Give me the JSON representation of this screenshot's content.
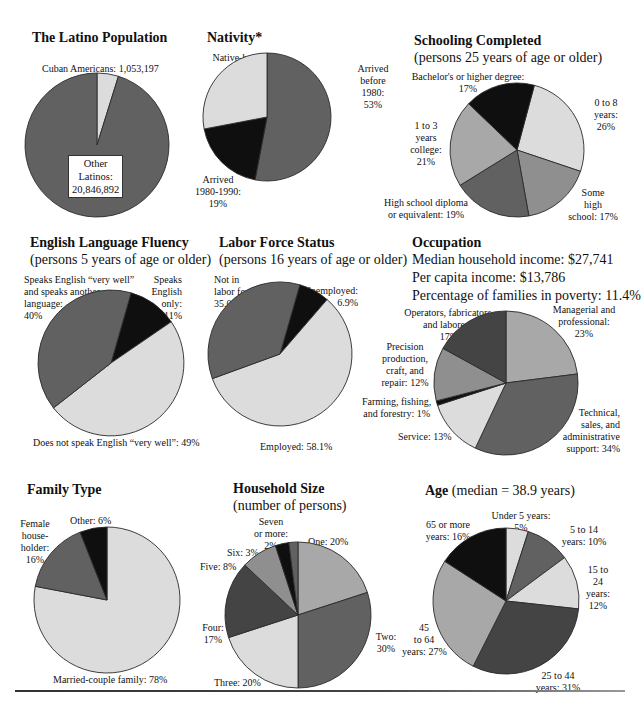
{
  "colors": {
    "light": "#dcdcdc",
    "mid": "#8f8f8f",
    "midlight": "#a8a8a8",
    "dark": "#616161",
    "darker": "#444444",
    "black": "#0f0f0f",
    "stroke": "#2a2a2a"
  },
  "chart_data": [
    {
      "id": "latino_population",
      "type": "pie",
      "title": "The Latino Population",
      "subtitle": "",
      "slices": [
        {
          "label": "Cuban Americans",
          "value": 1053197,
          "display": "Cuban Americans: 1,053,197",
          "color": "light"
        },
        {
          "label": "Other Latinos",
          "value": 20846892,
          "display": "Other Latinos: 20,846,892",
          "color": "dark"
        }
      ],
      "start_angle_deg": 0,
      "direction": "clockwise"
    },
    {
      "id": "nativity",
      "type": "pie",
      "title": "Nativity*",
      "subtitle": "",
      "slices": [
        {
          "label": "Arrived before 1980",
          "value": 53,
          "unit": "%",
          "color": "dark"
        },
        {
          "label": "Arrived 1980-1990",
          "value": 19,
          "unit": "%",
          "color": "black"
        },
        {
          "label": "Native-born",
          "value": 28,
          "unit": "%",
          "color": "light"
        }
      ],
      "start_angle_deg": 0,
      "direction": "clockwise"
    },
    {
      "id": "schooling_completed",
      "type": "pie",
      "title": "Schooling Completed",
      "subtitle": "(persons 25 years of age or older)",
      "slices": [
        {
          "label": "0 to 8 years",
          "value": 26,
          "unit": "%",
          "color": "light"
        },
        {
          "label": "Some high school",
          "value": 17,
          "unit": "%",
          "color": "mid"
        },
        {
          "label": "High school diploma or equivalent",
          "value": 19,
          "unit": "%",
          "color": "dark"
        },
        {
          "label": "1 to 3 years college",
          "value": 21,
          "unit": "%",
          "color": "midlight"
        },
        {
          "label": "Bachelor's or higher degree",
          "value": 17,
          "unit": "%",
          "color": "black"
        }
      ],
      "start_angle_deg": 15,
      "direction": "clockwise"
    },
    {
      "id": "english_language_fluency",
      "type": "pie",
      "title": "English Language Fluency",
      "subtitle": "(persons 5 years of age or older)",
      "slices": [
        {
          "label": "Speaks English only",
          "value": 11,
          "unit": "%",
          "color": "black"
        },
        {
          "label": "Does not speak English “very well”",
          "value": 49,
          "unit": "%",
          "color": "light"
        },
        {
          "label": "Speaks English “very well” and speaks another language",
          "value": 40,
          "unit": "%",
          "color": "dark"
        }
      ],
      "start_angle_deg": 16,
      "direction": "clockwise"
    },
    {
      "id": "labor_force_status",
      "type": "pie",
      "title": "Labor Force Status",
      "subtitle": "(persons 16 years of age or older)",
      "slices": [
        {
          "label": "Unemployed",
          "value": 6.9,
          "unit": "%",
          "color": "black"
        },
        {
          "label": "Employed",
          "value": 58.1,
          "unit": "%",
          "color": "light"
        },
        {
          "label": "Not in labor force",
          "value": 35.0,
          "unit": "%",
          "color": "dark"
        }
      ],
      "start_angle_deg": 16,
      "direction": "clockwise"
    },
    {
      "id": "occupation",
      "type": "pie",
      "title": "Occupation",
      "subtitle": "",
      "slices": [
        {
          "label": "Managerial and professional",
          "value": 23,
          "unit": "%",
          "color": "midlight"
        },
        {
          "label": "Technical, sales, and administrative support",
          "value": 34,
          "unit": "%",
          "color": "dark"
        },
        {
          "label": "Service",
          "value": 13,
          "unit": "%",
          "color": "light"
        },
        {
          "label": "Farming, fishing, and forestry",
          "value": 1,
          "unit": "%",
          "color": "black"
        },
        {
          "label": "Precision production, craft, and repair",
          "value": 12,
          "unit": "%",
          "color": "mid"
        },
        {
          "label": "Operators, fabricators, and laborers",
          "value": 17,
          "unit": "%",
          "color": "darker"
        }
      ],
      "start_angle_deg": 0,
      "direction": "clockwise"
    },
    {
      "id": "family_type",
      "type": "pie",
      "title": "Family Type",
      "subtitle": "",
      "slices": [
        {
          "label": "Married-couple family",
          "value": 78,
          "unit": "%",
          "color": "light"
        },
        {
          "label": "Female householder",
          "value": 16,
          "unit": "%",
          "color": "dark"
        },
        {
          "label": "Other",
          "value": 6,
          "unit": "%",
          "color": "black"
        }
      ],
      "start_angle_deg": 0,
      "direction": "clockwise"
    },
    {
      "id": "household_size",
      "type": "pie",
      "title": "Household Size",
      "subtitle": "(number of persons)",
      "slices": [
        {
          "label": "One",
          "value": 20,
          "unit": "%",
          "color": "midlight"
        },
        {
          "label": "Two",
          "value": 30,
          "unit": "%",
          "color": "dark"
        },
        {
          "label": "Three",
          "value": 20,
          "unit": "%",
          "color": "light"
        },
        {
          "label": "Four",
          "value": 17,
          "unit": "%",
          "color": "darker"
        },
        {
          "label": "Five",
          "value": 8,
          "unit": "%",
          "color": "mid"
        },
        {
          "label": "Six",
          "value": 3,
          "unit": "%",
          "color": "black"
        },
        {
          "label": "Seven or more",
          "value": 2,
          "unit": "%",
          "color": "dark"
        }
      ],
      "start_angle_deg": 0,
      "direction": "clockwise"
    },
    {
      "id": "age",
      "type": "pie",
      "title": "Age",
      "subtitle": "(median = 38.9 years)",
      "slices": [
        {
          "label": "Under 5 years",
          "value": 5,
          "unit": "%",
          "color": "light"
        },
        {
          "label": "5 to 14 years",
          "value": 10,
          "unit": "%",
          "color": "dark"
        },
        {
          "label": "15 to 24 years",
          "value": 12,
          "unit": "%",
          "color": "light"
        },
        {
          "label": "25 to 44 years",
          "value": 31,
          "unit": "%",
          "color": "darker"
        },
        {
          "label": "45 to 64 years",
          "value": 27,
          "unit": "%",
          "color": "midlight"
        },
        {
          "label": "65 or more years",
          "value": 16,
          "unit": "%",
          "color": "black"
        }
      ],
      "start_angle_deg": 0,
      "direction": "clockwise"
    }
  ],
  "panels": {
    "latino": {
      "title": "The Latino Population",
      "labels": {
        "cuban": "Cuban Americans: 1,053,197",
        "other_l1": "Other",
        "other_l2": "Latinos:",
        "other_l3": "20,846,892"
      }
    },
    "nativity": {
      "title": "Nativity*",
      "labels": {
        "native_l1": "Native-born:",
        "native_l2": "28%",
        "before_l1": "Arrived",
        "before_l2": "before",
        "before_l3": "1980:",
        "before_l4": "53%",
        "arr_l1": "Arrived",
        "arr_l2": "1980-1990:",
        "arr_l3": "19%"
      }
    },
    "schooling": {
      "title": "Schooling Completed",
      "subtitle": "(persons 25 years of age or older)",
      "labels": {
        "bach_l1": "Bachelor's or higher degree:",
        "bach_l2": "17%",
        "zero_l1": "0 to 8",
        "zero_l2": "years:",
        "zero_l3": "26%",
        "col_l1": "1 to 3",
        "col_l2": "years",
        "col_l3": "college:",
        "col_l4": "21%",
        "hs_l1": "High school diploma",
        "hs_l2": "or equivalent: 19%",
        "some_l1": "Some",
        "some_l2": "high",
        "some_l3": "school: 17%"
      }
    },
    "english": {
      "title": "English Language Fluency",
      "subtitle": "(persons 5 years of age or older)",
      "labels": {
        "well_l1": "Speaks English “very well”",
        "well_l2": "and speaks another",
        "well_l3": "language:",
        "well_l4": "40%",
        "only_l1": "Speaks",
        "only_l2": "English",
        "only_l3": "only:",
        "only_l4": "11%",
        "not": "Does not speak English “very well”: 49%"
      }
    },
    "labor": {
      "title": "Labor Force Status",
      "subtitle": "(persons 16 years of age or older)",
      "labels": {
        "not_l1": "Not in",
        "not_l2": "labor force:",
        "not_l3": "35.0%",
        "unemp_l1": "Unemployed:",
        "unemp_l2": "6.9%",
        "emp": "Employed: 58.1%"
      }
    },
    "occupation": {
      "title": "Occupation",
      "info": [
        "Median household income: $27,741",
        "Per capita income: $13,786",
        "Percentage of families in poverty: 11.4%"
      ],
      "labels": {
        "ops_l1": "Operators, fabricators,",
        "ops_l2": "and laborers:",
        "ops_l3": "17%",
        "mgr_l1": "Managerial and",
        "mgr_l2": "professional:",
        "mgr_l3": "23%",
        "prec_l1": "Precision",
        "prec_l2": "production,",
        "prec_l3": "craft, and",
        "prec_l4": "repair: 12%",
        "farm_l1": "Farming, fishing,",
        "farm_l2": "and forestry: 1%",
        "service": "Service: 13%",
        "tech_l1": "Technical,",
        "tech_l2": "sales, and",
        "tech_l3": "administrative",
        "tech_l4": "support: 34%"
      }
    },
    "family": {
      "title": "Family Type",
      "labels": {
        "fem_l1": "Female",
        "fem_l2": "house-",
        "fem_l3": "holder:",
        "fem_l4": "16%",
        "other": "Other: 6%",
        "married": "Married-couple family: 78%"
      }
    },
    "household": {
      "title": "Household Size",
      "subtitle": "(number of persons)",
      "labels": {
        "seven_l1": "Seven",
        "seven_l2": "or more:",
        "seven_l3": "2%",
        "one": "One: 20%",
        "six": "Six: 3%",
        "five": "Five: 8%",
        "four_l1": "Four:",
        "four_l2": "17%",
        "two_l1": "Two:",
        "two_l2": "30%",
        "three": "Three: 20%"
      }
    },
    "age": {
      "title": "Age",
      "subtitle": "(median = 38.9 years)",
      "labels": {
        "under5_l1": "Under 5 years:",
        "under5_l2": "5%",
        "five14_l1": "5 to 14",
        "five14_l2": "years: 10%",
        "sixtyfive_l1": "65 or more",
        "sixtyfive_l2": "years: 16%",
        "fifteen_l1": "15 to",
        "fifteen_l2": "24",
        "fifteen_l3": "years:",
        "fifteen_l4": "12%",
        "fortyfive_l1": "45",
        "fortyfive_l2": "to 64",
        "fortyfive_l3": "years: 27%",
        "twentyfive_l1": "25 to 44",
        "twentyfive_l2": "years: 31%"
      }
    }
  }
}
